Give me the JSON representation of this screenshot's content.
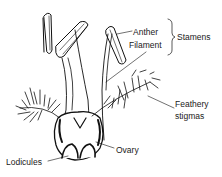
{
  "diagram": {
    "colors": {
      "ink": "#111111",
      "background": "#ffffff"
    },
    "labels": {
      "anther": "Anther",
      "filament": "Filament",
      "stamens": "Stamens",
      "feathery_stigmas_line1": "Feathery",
      "feathery_stigmas_line2": "stigmas",
      "ovary": "Ovary",
      "lodicules": "Lodicules"
    }
  }
}
